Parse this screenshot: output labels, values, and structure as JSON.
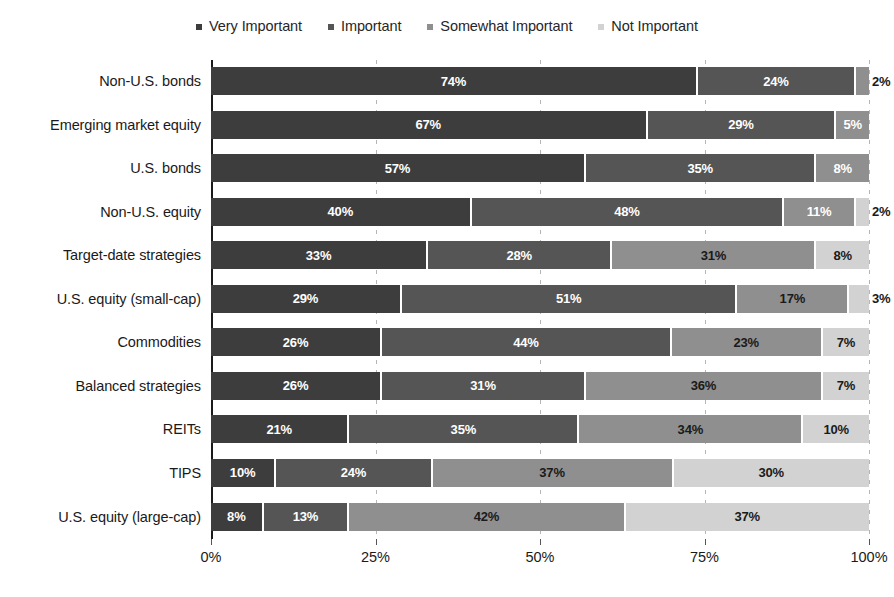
{
  "chart_data": {
    "type": "bar",
    "orientation": "horizontal",
    "stacked": true,
    "stack_mode": "percent",
    "title": "",
    "subtitle": "",
    "xlabel": "",
    "ylabel": "",
    "xlim": [
      0,
      100
    ],
    "xticks": [
      "0%",
      "25%",
      "50%",
      "75%",
      "100%"
    ],
    "xtick_values": [
      0,
      25,
      50,
      75,
      100
    ],
    "grid": "vertical-dashed",
    "legend_position": "top-center",
    "categories": [
      "Non-U.S. bonds",
      "Emerging market equity",
      "U.S. bonds",
      "Non-U.S. equity",
      "Target-date strategies",
      "U.S. equity (small-cap)",
      "Commodities",
      "Balanced strategies",
      "REITs",
      "TIPS",
      "U.S. equity (large-cap)"
    ],
    "series": [
      {
        "name": "Very Important",
        "color": "#3d3d3d",
        "values": [
          74,
          67,
          57,
          40,
          33,
          29,
          26,
          26,
          21,
          10,
          8
        ]
      },
      {
        "name": "Important",
        "color": "#555555",
        "values": [
          24,
          29,
          35,
          48,
          28,
          51,
          44,
          31,
          35,
          24,
          13
        ]
      },
      {
        "name": "Somewhat Important",
        "color": "#8f8f8f",
        "values": [
          2,
          5,
          8,
          11,
          31,
          17,
          23,
          36,
          34,
          37,
          42
        ]
      },
      {
        "name": "Not Important",
        "color": "#d2d2d2",
        "values": [
          0,
          0,
          0,
          2,
          8,
          3,
          7,
          7,
          10,
          30,
          37
        ]
      }
    ],
    "data_labels": [
      [
        "74%",
        "24%",
        "2%",
        ""
      ],
      [
        "67%",
        "29%",
        "5%",
        ""
      ],
      [
        "57%",
        "35%",
        "8%",
        ""
      ],
      [
        "40%",
        "48%",
        "11%",
        "2%"
      ],
      [
        "33%",
        "28%",
        "31%",
        "8%"
      ],
      [
        "29%",
        "51%",
        "17%",
        "3%"
      ],
      [
        "26%",
        "44%",
        "23%",
        "7%"
      ],
      [
        "26%",
        "31%",
        "36%",
        "7%"
      ],
      [
        "21%",
        "35%",
        "34%",
        "10%"
      ],
      [
        "10%",
        "24%",
        "37%",
        "30%"
      ],
      [
        "8%",
        "13%",
        "42%",
        "37%"
      ]
    ]
  },
  "legend": {
    "items": [
      {
        "label": "Very Important",
        "color": "#3d3d3d"
      },
      {
        "label": "Important",
        "color": "#555555"
      },
      {
        "label": "Somewhat Important",
        "color": "#8f8f8f"
      },
      {
        "label": "Not Important",
        "color": "#d2d2d2"
      }
    ]
  }
}
